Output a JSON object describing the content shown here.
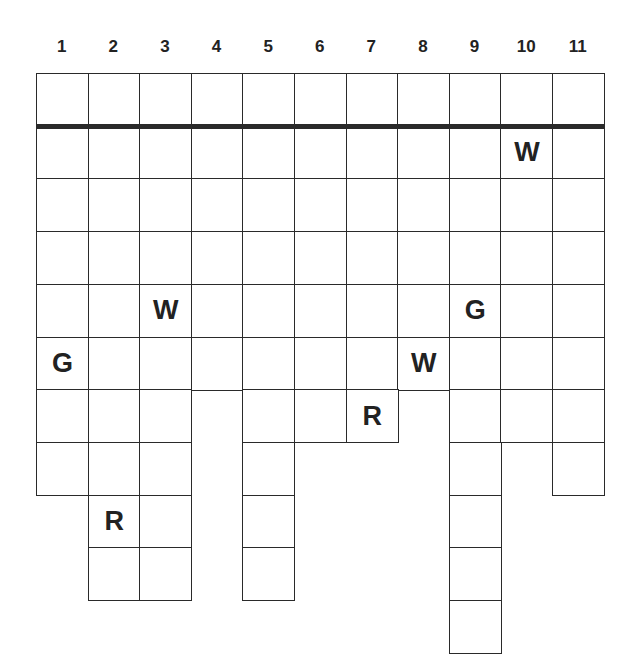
{
  "puzzle": {
    "type": "grid-word-puzzle",
    "columns": [
      "1",
      "2",
      "3",
      "4",
      "5",
      "6",
      "7",
      "8",
      "9",
      "10",
      "11"
    ],
    "row_count": 11,
    "thick_divider_after_row": 1,
    "rows": [
      {
        "row": 1,
        "cells": [
          1,
          2,
          3,
          4,
          5,
          6,
          7,
          8,
          9,
          10,
          11
        ]
      },
      {
        "row": 2,
        "cells": [
          1,
          2,
          3,
          4,
          5,
          6,
          7,
          8,
          9,
          10,
          11
        ]
      },
      {
        "row": 3,
        "cells": [
          1,
          2,
          3,
          4,
          5,
          6,
          7,
          8,
          9,
          10,
          11
        ]
      },
      {
        "row": 4,
        "cells": [
          1,
          2,
          3,
          4,
          5,
          6,
          7,
          8,
          9,
          10,
          11
        ]
      },
      {
        "row": 5,
        "cells": [
          1,
          2,
          3,
          4,
          5,
          6,
          7,
          8,
          9,
          10,
          11
        ]
      },
      {
        "row": 6,
        "cells": [
          1,
          2,
          3,
          4,
          5,
          6,
          7,
          8,
          9,
          10,
          11
        ]
      },
      {
        "row": 7,
        "cells": [
          1,
          2,
          3,
          5,
          6,
          7,
          9,
          10,
          11
        ]
      },
      {
        "row": 8,
        "cells": [
          1,
          2,
          3,
          5,
          9,
          11
        ]
      },
      {
        "row": 9,
        "cells": [
          2,
          3,
          5,
          9
        ]
      },
      {
        "row": 10,
        "cells": [
          2,
          3,
          5,
          9
        ]
      },
      {
        "row": 11,
        "cells": [
          9
        ]
      }
    ],
    "letters": [
      {
        "row": 2,
        "col": 10,
        "letter": "W"
      },
      {
        "row": 5,
        "col": 3,
        "letter": "W"
      },
      {
        "row": 5,
        "col": 9,
        "letter": "G"
      },
      {
        "row": 6,
        "col": 1,
        "letter": "G"
      },
      {
        "row": 6,
        "col": 8,
        "letter": "W"
      },
      {
        "row": 7,
        "col": 7,
        "letter": "R"
      },
      {
        "row": 9,
        "col": 2,
        "letter": "R"
      }
    ]
  },
  "colors": {
    "line": "#2a2a2a",
    "text": "#222222",
    "background": "#ffffff"
  }
}
